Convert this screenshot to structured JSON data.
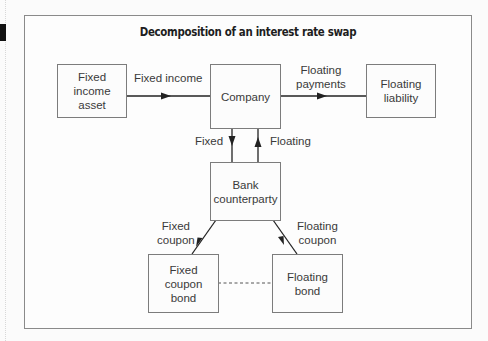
{
  "diagram": {
    "title": "Decomposition of an interest rate swap",
    "nodes": {
      "fixed_income_asset": {
        "label": "Fixed income asset",
        "lines": [
          "Fixed",
          "income",
          "asset"
        ]
      },
      "company": {
        "label": "Company"
      },
      "floating_liability": {
        "label": "Floating liability",
        "lines": [
          "Floating",
          "liability"
        ]
      },
      "bank_counterparty": {
        "label": "Bank counterparty",
        "lines": [
          "Bank",
          "counterparty"
        ]
      },
      "fixed_coupon_bond": {
        "label": "Fixed coupon bond",
        "lines": [
          "Fixed",
          "coupon",
          "bond"
        ]
      },
      "floating_bond": {
        "label": "Floating bond",
        "lines": [
          "Floating",
          "bond"
        ]
      }
    },
    "edges": [
      {
        "from": "fixed_income_asset",
        "to": "company",
        "label": "Fixed income",
        "style": "solid-arrow"
      },
      {
        "from": "company",
        "to": "floating_liability",
        "label": "Floating payments",
        "label_lines": [
          "Floating",
          "payments"
        ],
        "style": "solid-arrow"
      },
      {
        "from": "company",
        "to": "bank_counterparty",
        "label": "Fixed",
        "style": "solid-arrow"
      },
      {
        "from": "bank_counterparty",
        "to": "company",
        "label": "Floating",
        "style": "solid-arrow"
      },
      {
        "from": "bank_counterparty",
        "to": "fixed_coupon_bond",
        "label": "Fixed coupon",
        "label_lines": [
          "Fixed",
          "coupon"
        ],
        "style": "solid-arrow"
      },
      {
        "from": "floating_bond",
        "to": "bank_counterparty",
        "label": "Floating coupon",
        "label_lines": [
          "Floating",
          "coupon"
        ],
        "style": "solid-arrow"
      },
      {
        "from": "fixed_coupon_bond",
        "to": "floating_bond",
        "label": "",
        "style": "dashed"
      }
    ]
  },
  "colors": {
    "line": "#222222",
    "box_border": "#7c7c7c",
    "frame_border": "#8a8a8a",
    "text": "#3a3a3a",
    "title": "#1e1e1e"
  }
}
